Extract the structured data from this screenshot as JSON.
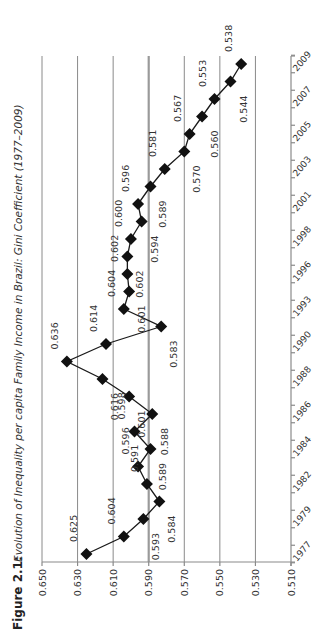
{
  "figure": {
    "label": "Figure 2.1:",
    "caption": "Evolution of Inequality per capita Family Income in Brazil: Gini Coefficient (1977–2009)"
  },
  "chart_data": {
    "type": "line",
    "title": "Evolution of Inequality per capita Family Income in Brazil: Gini Coefficient (1977–2009)",
    "xlabel": "",
    "ylabel": "",
    "orientation": "rotated 90 degrees counter-clockwise (years run bottom-to-top, values right-to-left)",
    "ylim": [
      0.51,
      0.65
    ],
    "yticks": [
      "0.650",
      "0.630",
      "0.610",
      "0.590",
      "0.570",
      "0.550",
      "0.530",
      "0.510"
    ],
    "grid": true,
    "reference_line": 0.59,
    "x_tick_labels": [
      "1977",
      "1979",
      "1982",
      "1984",
      "1986",
      "1988",
      "1990",
      "1993",
      "1996",
      "1998",
      "2001",
      "2003",
      "2005",
      "2007",
      "2009"
    ],
    "categories": [
      "1977",
      "1978",
      "1979",
      "1981",
      "1982",
      "1983",
      "1984",
      "1985",
      "1986",
      "1987",
      "1988",
      "1989",
      "1990",
      "1992",
      "1993",
      "1995",
      "1996",
      "1997",
      "1998",
      "1999",
      "2001",
      "2002",
      "2003",
      "2004",
      "2005",
      "2006",
      "2007",
      "2008",
      "2009"
    ],
    "series": [
      {
        "name": "Gini Coefficient",
        "marker": "diamond",
        "values": [
          0.625,
          0.604,
          0.593,
          0.584,
          0.591,
          0.596,
          0.589,
          0.598,
          0.588,
          0.601,
          0.616,
          0.636,
          0.614,
          0.583,
          0.604,
          0.601,
          0.602,
          0.602,
          0.6,
          0.594,
          0.596,
          0.589,
          0.581,
          0.57,
          0.567,
          0.56,
          0.553,
          0.544,
          0.538
        ],
        "data_labels": [
          "0.625",
          "0.604",
          "0.593",
          "0.584",
          "0.591",
          "0.596",
          "0.589",
          "0.598",
          "0.588",
          "0.601",
          "0.616",
          "0.636",
          "0.614",
          "0.583",
          "0.604",
          "0.601",
          "0.602",
          "0.602",
          "0.600",
          "0.594",
          "0.596",
          "0.589",
          "0.581",
          "0.570",
          "0.567",
          "0.560",
          "0.553",
          "0.544",
          "0.538"
        ],
        "label_side": [
          "L",
          "L",
          "R",
          "R",
          "L",
          "L",
          "R",
          "L",
          "R",
          "R",
          "R",
          "L",
          "L",
          "R",
          "L",
          "R",
          "L",
          "R",
          "L",
          "R",
          "L",
          "R",
          "L",
          "R",
          "L",
          "R",
          "L",
          "R",
          "L"
        ]
      }
    ],
    "legend": null
  }
}
